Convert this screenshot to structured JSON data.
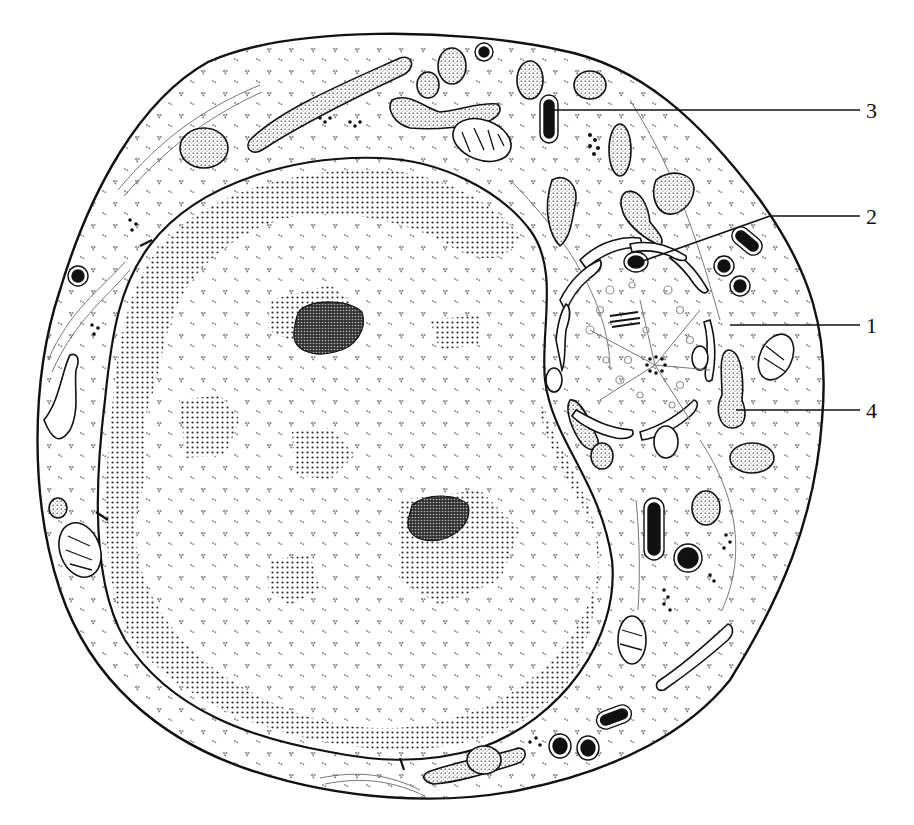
{
  "diagram": {
    "type": "cell-ultrastructure-illustration",
    "style": "black-and-white stippled line drawing",
    "labels": [
      {
        "id": "3",
        "text": "3",
        "points_to": "electron-dense granule in upper cytoplasm"
      },
      {
        "id": "2",
        "text": "2",
        "points_to": "dense-core vesicle near Golgi region"
      },
      {
        "id": "1",
        "text": "1",
        "points_to": "Golgi complex / centrosome region"
      },
      {
        "id": "4",
        "text": "4",
        "points_to": "stippled rough ER cisterna"
      }
    ],
    "structures": [
      "plasma-membrane",
      "nucleus",
      "nuclear-envelope",
      "heterochromatin",
      "nucleolus",
      "nucleolus",
      "rough-endoplasmic-reticulum",
      "mitochondria",
      "golgi-complex",
      "centrioles",
      "ribosomes",
      "secretory-granules",
      "microtubules"
    ],
    "colors": {
      "ink": "#111111",
      "background": "#ffffff",
      "fiber": "#777777"
    }
  }
}
